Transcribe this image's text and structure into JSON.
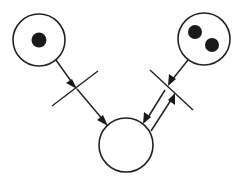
{
  "diagram": {
    "type": "petri-net",
    "colors": {
      "stroke": "#222222",
      "token": "#1a1a1a",
      "background": "#ffffff"
    },
    "places": [
      {
        "id": "p1",
        "label": "",
        "tokens": 1,
        "position": "top-left"
      },
      {
        "id": "p2",
        "label": "",
        "tokens": 2,
        "position": "top-right"
      },
      {
        "id": "p3",
        "label": "",
        "tokens": 0,
        "position": "bottom-center"
      }
    ],
    "transitions": [
      {
        "id": "t1",
        "label": "",
        "position": "left-middle"
      },
      {
        "id": "t2",
        "label": "",
        "position": "right-middle"
      }
    ],
    "arcs": [
      {
        "from": "p1",
        "to": "t1"
      },
      {
        "from": "t1",
        "to": "p3"
      },
      {
        "from": "p2",
        "to": "t2"
      },
      {
        "from": "t2",
        "to": "p3"
      },
      {
        "from": "p3",
        "to": "t2"
      }
    ]
  }
}
